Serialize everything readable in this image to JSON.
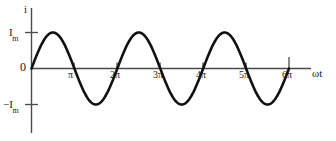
{
  "figure": {
    "type": "line-plot",
    "background_color": "#ffffff",
    "curve_color": "#111111",
    "axis_color": "#4a4a4a",
    "y_axis_label": "i",
    "x_axis_label": "ωt",
    "y_labels": {
      "positive_peak_base": "I",
      "positive_peak_sub": "m",
      "zero": "0",
      "negative_peak_base": "−I",
      "negative_peak_sub": "m"
    }
  },
  "chart_data": {
    "type": "line",
    "title": "",
    "subtitle": "",
    "xlabel": "ωt",
    "ylabel": "i",
    "grid": false,
    "legend": "none",
    "equation": "i = I_m sin(ωt)",
    "xlim": [
      0,
      19.477
    ],
    "ylim": [
      -1.35,
      1.35
    ],
    "x_tick_values": [
      3.1416,
      6.2832,
      9.4248,
      12.5664,
      15.708,
      18.8496
    ],
    "x_tick_labels": [
      "π",
      "2π",
      "3π",
      "4π",
      "5π",
      "6π"
    ],
    "y_tick_values": [
      1,
      0,
      -1
    ],
    "y_tick_labels": [
      "Im",
      "0",
      "−Im"
    ],
    "series": [
      {
        "name": "i",
        "amplitude": 1,
        "periods": 3,
        "phase": 0,
        "x": [
          0,
          0.3927,
          0.7854,
          1.1781,
          1.5708,
          1.9635,
          2.3562,
          2.7489,
          3.1416,
          3.5343,
          3.927,
          4.3197,
          4.7124,
          5.1051,
          5.4978,
          5.8905,
          6.2832,
          6.6759,
          7.0686,
          7.4613,
          7.854,
          8.2467,
          8.6394,
          9.0321,
          9.4248,
          9.8175,
          10.2102,
          10.6029,
          10.9956,
          11.3883,
          11.781,
          12.1737,
          12.5664,
          12.9591,
          13.3518,
          13.7445,
          14.1372,
          14.5299,
          14.9226,
          15.3153,
          15.708,
          16.1007,
          16.4934,
          16.8861,
          17.2788,
          17.6715,
          18.0642,
          18.4569,
          18.8496
        ],
        "values": [
          0,
          0.3827,
          0.7071,
          0.9239,
          1,
          0.9239,
          0.7071,
          0.3827,
          0,
          -0.3827,
          -0.7071,
          -0.9239,
          -1,
          -0.9239,
          -0.7071,
          -0.3827,
          0,
          0.3827,
          0.7071,
          0.9239,
          1,
          0.9239,
          0.7071,
          0.3827,
          0,
          -0.3827,
          -0.7071,
          -0.9239,
          -1,
          -0.9239,
          -0.7071,
          -0.3827,
          0,
          0.3827,
          0.7071,
          0.9239,
          1,
          0.9239,
          0.7071,
          0.3827,
          0,
          -0.3827,
          -0.7071,
          -0.9239,
          -1,
          -0.9239,
          -0.7071,
          -0.3827,
          0
        ]
      }
    ]
  }
}
